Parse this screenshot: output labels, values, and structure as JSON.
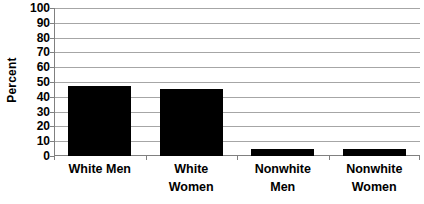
{
  "chart_data": {
    "type": "bar",
    "title": "",
    "subtitle": "",
    "xlabel": "",
    "ylabel": "Percent",
    "categories": [
      "White Men",
      "White Women",
      "Nonwhite Men",
      "Nonwhite Women"
    ],
    "values": [
      47,
      45,
      5,
      5
    ],
    "ylim": [
      0,
      100
    ],
    "y_tick_step": 10,
    "y_ticks": [
      0,
      10,
      20,
      30,
      40,
      50,
      60,
      70,
      80,
      90,
      100
    ],
    "y_tick_labels": [
      "0",
      "10",
      "20",
      "30",
      "40",
      "50",
      "60",
      "70",
      "80",
      "90",
      "100"
    ],
    "grid": true,
    "grid_axis": "y",
    "legend": false,
    "legend_position": "none",
    "series": [
      {
        "name": "Percent",
        "color": "#000000",
        "values": [
          47,
          45,
          5,
          5
        ]
      }
    ],
    "category_label_lines": [
      [
        "White Men"
      ],
      [
        "White",
        "Women"
      ],
      [
        "Nonwhite",
        "Men"
      ],
      [
        "Nonwhite",
        "Women"
      ]
    ],
    "colors": {
      "bar": "#000000",
      "gridline": "#a6a6a6",
      "axis": "#808080",
      "text": "#000000",
      "background": "#ffffff"
    }
  }
}
